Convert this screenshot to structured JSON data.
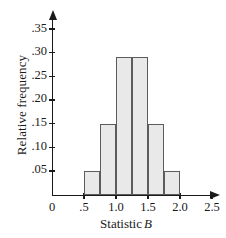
{
  "chart_data": {
    "type": "bar",
    "title": "",
    "xlabel": "Statistic B",
    "xlabel_text": "Statistic",
    "xlabel_symbol": "B",
    "ylabel": "Relative frequency",
    "xlim": [
      0,
      2.5
    ],
    "ylim": [
      0,
      0.375
    ],
    "grid": false,
    "legend": false,
    "bar_width": 0.25,
    "bin_edges": [
      0.5,
      0.75,
      1.0,
      1.25,
      1.5,
      1.75,
      2.0
    ],
    "categories": [
      "0.50-0.75",
      "0.75-1.00",
      "1.00-1.25",
      "1.25-1.50",
      "1.50-1.75",
      "1.75-2.00"
    ],
    "values": [
      0.05,
      0.15,
      0.29,
      0.29,
      0.15,
      0.05
    ],
    "xticks": [
      0,
      0.5,
      1.0,
      1.5,
      2.0,
      2.5
    ],
    "xtick_labels": [
      "0",
      ".5",
      "1.0",
      "1.5",
      "2.0",
      "2.5"
    ],
    "yticks": [
      0.05,
      0.1,
      0.15,
      0.2,
      0.25,
      0.3,
      0.35
    ],
    "ytick_labels": [
      ".05",
      ".10",
      ".15",
      ".20",
      ".25",
      ".30",
      ".35"
    ],
    "bar_fill_color": "#e9e9e9",
    "bar_edge_color": "#5c5c5c",
    "axis_color": "#1a1a1a"
  }
}
